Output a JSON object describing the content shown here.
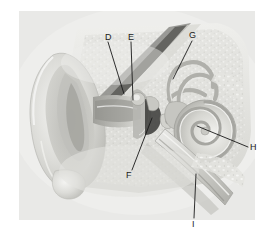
{
  "figure": {
    "style": "grayscale anatomical illustration",
    "panel_background": "#e9e9e7",
    "page_background": "#ffffff",
    "label_color": "#1a1a1a"
  },
  "labels": [
    {
      "id": "D",
      "text": "D",
      "x": 105,
      "y": 33,
      "target_x": 131,
      "target_y": 93,
      "points_to": "incus / malleus head region (ossicles, upper)"
    },
    {
      "id": "E",
      "text": "E",
      "x": 128,
      "y": 33,
      "target_x": 139,
      "target_y": 98,
      "points_to": "tympanic membrane / eardrum region"
    },
    {
      "id": "F",
      "text": "F",
      "x": 128,
      "y": 175,
      "target_x": 155,
      "target_y": 117,
      "points_to": "stapes / oval window region"
    },
    {
      "id": "G",
      "text": "G",
      "x": 190,
      "y": 31,
      "target_x": 170,
      "target_y": 74,
      "points_to": "semicircular canals"
    },
    {
      "id": "H",
      "text": "H",
      "x": 250,
      "y": 145,
      "target_x": 197,
      "target_y": 125,
      "points_to": "cochlea"
    },
    {
      "id": "I",
      "text": "I",
      "x": 191,
      "y": 222,
      "target_x": 196,
      "target_y": 178,
      "points_to": "eustachian tube"
    }
  ],
  "structures": [
    {
      "name": "auricle-pinna",
      "description": "outer ear flap, left side of illustration"
    },
    {
      "name": "ear-canal",
      "description": "external auditory meatus running inward"
    },
    {
      "name": "tympanic-membrane",
      "description": "eardrum at the end of the canal"
    },
    {
      "name": "ossicles",
      "description": "malleus, incus and stapes in middle ear cavity"
    },
    {
      "name": "semicircular-canals",
      "description": "looping canals of the vestibular system"
    },
    {
      "name": "cochlea",
      "description": "spiral snail-shaped organ of hearing"
    },
    {
      "name": "eustachian-tube",
      "description": "tube descending toward the pharynx"
    },
    {
      "name": "temporal-bone",
      "description": "speckled bone matrix surrounding inner ear"
    }
  ]
}
